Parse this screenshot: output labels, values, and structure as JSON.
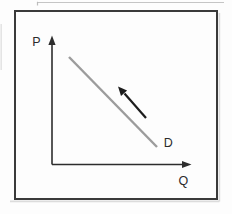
{
  "diagram": {
    "type": "economics-demand-curve",
    "y_axis_label": "P",
    "x_axis_label": "Q",
    "curve_label": "D",
    "curve": "demand",
    "curve_direction": "downward-sloping",
    "movement_arrow_direction": "up-left-along-curve",
    "colors": {
      "background": "#fdfdfd",
      "frame_border": "#3a3a3a",
      "frame_shadow": "#d8d8d8",
      "axis": "#2d2d2d",
      "demand_line": "#9c9c9c",
      "movement_arrow": "#1c1c1c",
      "label_text": "#2b2b2b",
      "scan_artifact": "#b2b2b2",
      "scan_artifact_light": "#d8d8d8"
    }
  }
}
